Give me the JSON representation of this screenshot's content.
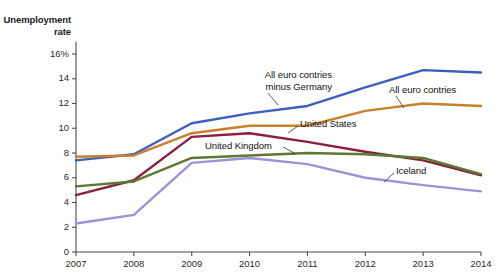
{
  "chart_data": {
    "type": "line",
    "title": "",
    "ylabel": "Unemployment\nrate",
    "xlabel": "",
    "x": [
      2007,
      2008,
      2009,
      2010,
      2011,
      2012,
      2013,
      2014
    ],
    "xtick_labels": [
      "2007",
      "2008",
      "2009",
      "2010",
      "2011",
      "2012",
      "2013",
      "2014"
    ],
    "ytick_labels": [
      "0",
      "2",
      "4",
      "6",
      "8",
      "10",
      "12",
      "14",
      "16%"
    ],
    "ytick_values": [
      0,
      2,
      4,
      6,
      8,
      10,
      12,
      14,
      16
    ],
    "ylim": [
      0,
      17
    ],
    "xlim": [
      2007,
      2014
    ],
    "grid": false,
    "legend": "inline-annotations",
    "series": [
      {
        "name": "All euro contries minus Germany",
        "color": "#3a5fbe",
        "values": [
          7.4,
          7.9,
          10.4,
          11.2,
          11.8,
          13.3,
          14.7,
          14.5
        ]
      },
      {
        "name": "All euro contries",
        "color": "#c8812a",
        "values": [
          7.7,
          7.8,
          9.6,
          10.2,
          10.2,
          11.4,
          12.0,
          11.8
        ]
      },
      {
        "name": "United States",
        "color": "#8b1f3f",
        "values": [
          4.6,
          5.8,
          9.3,
          9.6,
          8.9,
          8.1,
          7.4,
          6.2
        ]
      },
      {
        "name": "United Kingdom",
        "color": "#5b7a30",
        "values": [
          5.3,
          5.7,
          7.6,
          7.8,
          8.0,
          7.9,
          7.6,
          6.3
        ]
      },
      {
        "name": "Iceland",
        "color": "#9b93da",
        "values": [
          2.3,
          3.0,
          7.2,
          7.6,
          7.1,
          6.0,
          5.4,
          4.9
        ]
      }
    ],
    "annotations": [
      {
        "text": "All euro contries\nminus Germany",
        "series": "All euro contries minus Germany"
      },
      {
        "text": "All euro contries",
        "series": "All euro contries"
      },
      {
        "text": "United States",
        "series": "United States"
      },
      {
        "text": "United Kingdom",
        "series": "United Kingdom"
      },
      {
        "text": "Iceland",
        "series": "Iceland"
      }
    ]
  },
  "axis": {
    "y_title": "Unemployment\nrate",
    "y_ticks": [
      "16%",
      "14",
      "12",
      "10",
      "8",
      "6",
      "4",
      "2",
      "0"
    ],
    "x_ticks": [
      "2007",
      "2008",
      "2009",
      "2010",
      "2011",
      "2012",
      "2013",
      "2014"
    ]
  },
  "labels": {
    "euro_minus_germany": "All euro contries\nminus Germany",
    "all_euro": "All euro contries",
    "united_states": "United States",
    "united_kingdom": "United Kingdom",
    "iceland": "Iceland"
  }
}
